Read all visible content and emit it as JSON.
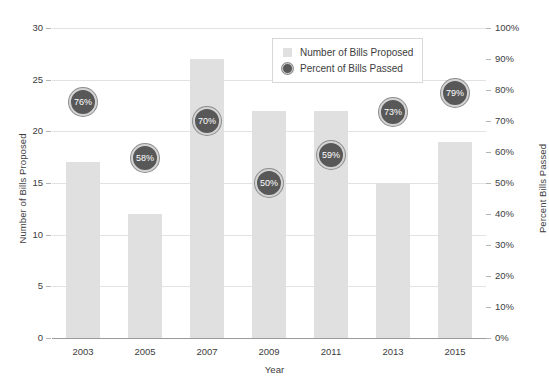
{
  "chart_data": {
    "type": "bar",
    "title": "",
    "categories": [
      "2003",
      "2005",
      "2007",
      "2009",
      "2011",
      "2013",
      "2015"
    ],
    "xlabel": "Year",
    "ylabel": "Number of Bills Proposed",
    "y2label": "Percent Bills Passed",
    "ylim": [
      0,
      30
    ],
    "y2lim": [
      0,
      100
    ],
    "grid": true,
    "legend_position": "top-right",
    "series": [
      {
        "name": "Number of Bills Proposed",
        "type": "bar",
        "axis": "left",
        "values": [
          17,
          12,
          27,
          22,
          22,
          15,
          19
        ]
      },
      {
        "name": "Percent of Bills Passed",
        "type": "bubble",
        "axis": "right",
        "values": [
          76,
          58,
          70,
          50,
          59,
          73,
          79
        ],
        "labels": [
          "76%",
          "58%",
          "70%",
          "50%",
          "59%",
          "73%",
          "79%"
        ]
      }
    ],
    "left_ticks": [
      "0",
      "5",
      "10",
      "15",
      "20",
      "25",
      "30"
    ],
    "left_tick_values": [
      0,
      5,
      10,
      15,
      20,
      25,
      30
    ],
    "right_ticks": [
      "0%",
      "10%",
      "20%",
      "30%",
      "40%",
      "50%",
      "60%",
      "70%",
      "80%",
      "90%",
      "100%"
    ],
    "right_tick_values": [
      0,
      10,
      20,
      30,
      40,
      50,
      60,
      70,
      80,
      90,
      100
    ],
    "colors": {
      "bar": "#e0e0e0",
      "bubble_fill": "#585858",
      "bubble_ring": "#d3d3d3",
      "bubble_text": "#ffffff",
      "gridline": "#e2e2e2",
      "axis": "#9a9a9a",
      "text": "#3d3d3d",
      "background": "#ffffff"
    }
  },
  "legend": {
    "items": [
      {
        "label": "Number of Bills Proposed",
        "marker": "bar-swatch-icon"
      },
      {
        "label": "Percent of Bills Passed",
        "marker": "bubble-swatch-icon"
      }
    ]
  },
  "axes": {
    "x_title": "Year",
    "y_left_title": "Number of Bills Proposed",
    "y_right_title": "Percent Bills Passed"
  }
}
